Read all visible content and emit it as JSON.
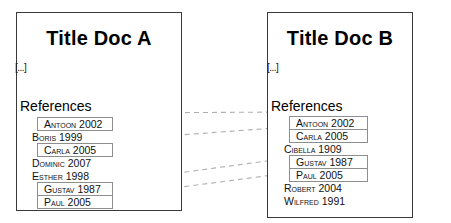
{
  "diagram": {
    "link_color": "#b0b0b0",
    "box_border_color": "#8e8e8e",
    "doc_border_color": "#3a3a3a"
  },
  "doc_a": {
    "title": "Title Doc A",
    "ellipsis": "[...]",
    "references_heading": "References",
    "references": [
      {
        "label": "Antoon 2002",
        "name": "Antoon",
        "year": "2002",
        "matched": true
      },
      {
        "label": "Boris 1999",
        "name": "Boris",
        "year": "1999",
        "matched": false
      },
      {
        "label": "Carla 2005",
        "name": "Carla",
        "year": "2005",
        "matched": true
      },
      {
        "label": "Dominic 2007",
        "name": "Dominic",
        "year": "2007",
        "matched": false
      },
      {
        "label": "Esther 1998",
        "name": "Esther",
        "year": "1998",
        "matched": false
      },
      {
        "label": "Gustav 1987",
        "name": "Gustav",
        "year": "1987",
        "matched": true
      },
      {
        "label": "Paul 2005",
        "name": "Paul",
        "year": "2005",
        "matched": true
      }
    ]
  },
  "doc_b": {
    "title": "Title Doc B",
    "ellipsis": "[...]",
    "references_heading": "References",
    "references": [
      {
        "label": "Antoon 2002",
        "name": "Antoon",
        "year": "2002",
        "matched": true
      },
      {
        "label": "Carla 2005",
        "name": "Carla",
        "year": "2005",
        "matched": true
      },
      {
        "label": "Cibella 1909",
        "name": "Cibella",
        "year": "1909",
        "matched": false
      },
      {
        "label": "Gustav 1987",
        "name": "Gustav",
        "year": "1987",
        "matched": true
      },
      {
        "label": "Paul 2005",
        "name": "Paul",
        "year": "2005",
        "matched": true
      },
      {
        "label": "Robert 2004",
        "name": "Robert",
        "year": "2004",
        "matched": false
      },
      {
        "label": "Wilfred 1991",
        "name": "Wilfred",
        "year": "1991",
        "matched": false
      }
    ]
  },
  "links": [
    {
      "label": "Antoon 2002",
      "from_index": 0,
      "to_index": 0,
      "x1": 113,
      "y1": 113,
      "x2": 288,
      "y2": 112
    },
    {
      "label": "Carla 2005",
      "from_index": 2,
      "to_index": 1,
      "x1": 113,
      "y1": 140,
      "x2": 288,
      "y2": 127
    },
    {
      "label": "Gustav 1987",
      "from_index": 5,
      "to_index": 3,
      "x1": 113,
      "y1": 182,
      "x2": 288,
      "y2": 158
    },
    {
      "label": "Paul 2005",
      "from_index": 6,
      "to_index": 4,
      "x1": 113,
      "y1": 196,
      "x2": 288,
      "y2": 173
    }
  ]
}
